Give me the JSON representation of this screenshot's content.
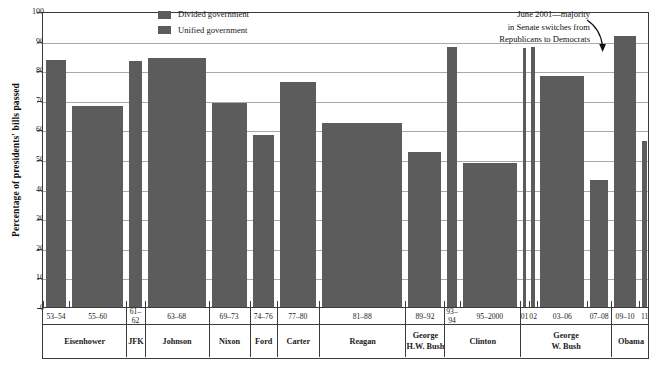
{
  "chart_data": {
    "type": "bar",
    "title": "",
    "xlabel": "",
    "ylabel": "Percentage of presidents' bills passed",
    "ylim": [
      0,
      100
    ],
    "yticks": [
      0,
      10,
      20,
      30,
      40,
      50,
      60,
      70,
      80,
      90,
      100
    ],
    "ytick_labels": [
      "0",
      "10",
      "20",
      "30",
      "40",
      "50",
      "60",
      "70",
      "80",
      "90",
      "100"
    ],
    "grid": true,
    "legend_position": "top-center",
    "legend": [
      {
        "label": "Divided government",
        "color": "#5c5c5c"
      },
      {
        "label": "Unified government",
        "color": "#5c5c5c"
      }
    ],
    "categories": [
      "53–54",
      "55–60",
      "61–62",
      "63–68",
      "69–73",
      "74–76",
      "77–80",
      "81–88",
      "89–92",
      "93–94",
      "95–2000",
      "01",
      "02",
      "03–06",
      "07–08",
      "09–10",
      "11"
    ],
    "values": [
      83.5,
      68,
      83,
      84,
      69,
      58,
      76,
      62,
      52.5,
      88,
      48.5,
      87.5,
      88,
      78,
      43,
      91.5,
      56
    ],
    "series": [
      {
        "name": "Presidents' bills passed",
        "points": [
          {
            "years": "53–54",
            "value": 83.5,
            "government": "Unified",
            "president": "Eisenhower"
          },
          {
            "years": "55–60",
            "value": 68,
            "government": "Divided",
            "president": "Eisenhower"
          },
          {
            "years": "61–62",
            "value": 83,
            "government": "Unified",
            "president": "JFK"
          },
          {
            "years": "63–68",
            "value": 84,
            "government": "Unified",
            "president": "Johnson"
          },
          {
            "years": "69–73",
            "value": 69,
            "government": "Divided",
            "president": "Nixon"
          },
          {
            "years": "74–76",
            "value": 58,
            "government": "Divided",
            "president": "Ford"
          },
          {
            "years": "77–80",
            "value": 76,
            "government": "Unified",
            "president": "Carter"
          },
          {
            "years": "81–88",
            "value": 62,
            "government": "Divided",
            "president": "Reagan"
          },
          {
            "years": "89–92",
            "value": 52.5,
            "government": "Divided",
            "president": "George H.W. Bush"
          },
          {
            "years": "93–94",
            "value": 88,
            "government": "Unified",
            "president": "Clinton"
          },
          {
            "years": "95–2000",
            "value": 48.5,
            "government": "Divided",
            "president": "Clinton"
          },
          {
            "years": "01",
            "value": 87.5,
            "government": "Unified",
            "president": "George W. Bush"
          },
          {
            "years": "02",
            "value": 88,
            "government": "Divided",
            "president": "George W. Bush"
          },
          {
            "years": "03–06",
            "value": 78,
            "government": "Unified",
            "president": "George W. Bush"
          },
          {
            "years": "07–08",
            "value": 43,
            "government": "Divided",
            "president": "George W. Bush"
          },
          {
            "years": "09–10",
            "value": 91.5,
            "government": "Unified",
            "president": "Obama"
          },
          {
            "years": "11",
            "value": 56,
            "government": "Divided",
            "president": "Obama"
          }
        ]
      }
    ],
    "annotations": [
      {
        "name": "senate-switch-note",
        "lines": [
          "June 2001—majority",
          "in Senate switches from",
          "Republicans to Democrats"
        ],
        "points_to": "01"
      }
    ],
    "presidents": [
      {
        "name": "Eisenhower",
        "line1": "Eisenhower",
        "line2": ""
      },
      {
        "name": "JFK",
        "line1": "JFK",
        "line2": ""
      },
      {
        "name": "Johnson",
        "line1": "Johnson",
        "line2": ""
      },
      {
        "name": "Nixon",
        "line1": "Nixon",
        "line2": ""
      },
      {
        "name": "Ford",
        "line1": "Ford",
        "line2": ""
      },
      {
        "name": "Carter",
        "line1": "Carter",
        "line2": ""
      },
      {
        "name": "Reagan",
        "line1": "Reagan",
        "line2": ""
      },
      {
        "name": "George H.W. Bush",
        "line1": "George",
        "line2": "H.W. Bush"
      },
      {
        "name": "Clinton",
        "line1": "Clinton",
        "line2": ""
      },
      {
        "name": "George W. Bush",
        "line1": "George",
        "line2": "W. Bush"
      },
      {
        "name": "Obama",
        "line1": "Obama",
        "line2": ""
      }
    ],
    "colors": {
      "bar": "#5c5c5c",
      "gridline": "#a9a9a9",
      "frame": "#3b3b3b",
      "text": "#1a1a1a",
      "background": "#ffffff"
    }
  }
}
